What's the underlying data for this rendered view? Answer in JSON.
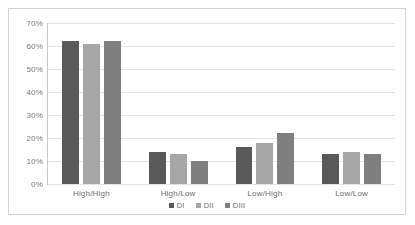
{
  "chart_data": {
    "type": "bar",
    "title": "",
    "xlabel": "",
    "ylabel": "",
    "categories": [
      "High/High",
      "High/Low",
      "Low/High",
      "Low/Low"
    ],
    "series": [
      {
        "name": "DI",
        "color": "#595959",
        "values": [
          62,
          14,
          16,
          13
        ]
      },
      {
        "name": "DII",
        "color": "#a6a6a6",
        "values": [
          61,
          13,
          18,
          14
        ]
      },
      {
        "name": "DIII",
        "color": "#7f7f7f",
        "values": [
          62,
          10,
          22,
          13
        ]
      }
    ],
    "ylim": [
      0,
      70
    ],
    "ytick_values": [
      0,
      10,
      20,
      30,
      40,
      50,
      60,
      70
    ],
    "ytick_labels": [
      "0%",
      "10%",
      "20%",
      "30%",
      "40%",
      "50%",
      "60%",
      "70%"
    ],
    "y_axis_format": "percent",
    "grid": true,
    "legend_position": "bottom",
    "plot_background": "#ffffff",
    "gridline_color": "#e4e4e4",
    "axis_color": "#c9c9c9",
    "frame_border_color": "#d4d4d4",
    "tick_label_color": "#7b7b7b"
  }
}
